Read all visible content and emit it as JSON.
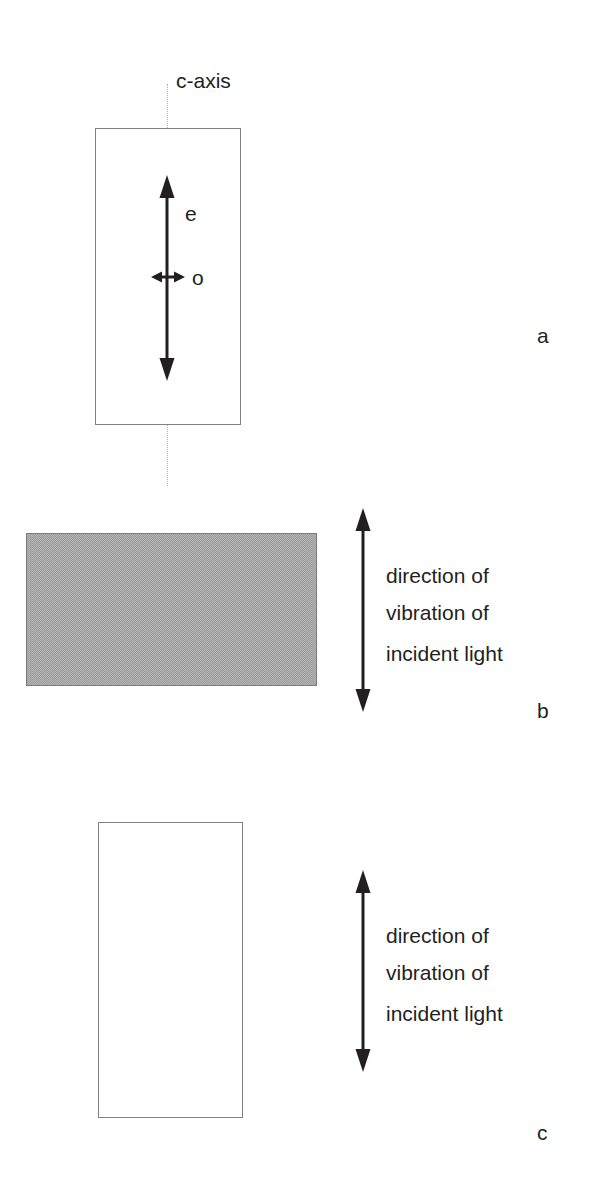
{
  "figure": {
    "background_color": "#ffffff",
    "ink_color": "#231f20",
    "shaded_fill_color": "#9a9a9a",
    "outline_color": "#808080"
  },
  "panels": [
    {
      "letter": "a",
      "caxis_label": "c-axis",
      "ray_labels": {
        "extraordinary": "e",
        "ordinary": "o"
      },
      "crystal_fill": "white"
    },
    {
      "letter": "b",
      "vibration_caption": [
        "direction of",
        "vibration of",
        "incident light"
      ],
      "crystal_fill": "shaded"
    },
    {
      "letter": "c",
      "vibration_caption": [
        "direction of",
        "vibration of",
        "incident light"
      ],
      "crystal_fill": "white"
    }
  ],
  "icons": {
    "double_arrow_vertical": "double-headed-vertical-arrow",
    "double_arrow_horizontal": "double-headed-horizontal-arrow"
  }
}
